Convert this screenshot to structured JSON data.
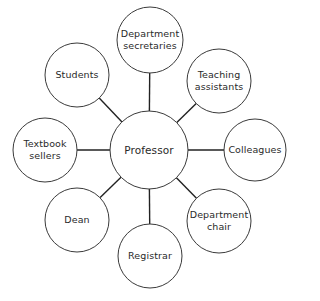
{
  "diagram": {
    "type": "hub-and-spoke",
    "center": {
      "id": "professor",
      "label_lines": [
        "Professor"
      ],
      "x": 149,
      "y": 150,
      "r": 39
    },
    "nodes": [
      {
        "id": "department-secretaries",
        "label_lines": [
          "Department",
          "secretaries"
        ],
        "x": 150,
        "y": 40,
        "r": 33
      },
      {
        "id": "teaching-assistants",
        "label_lines": [
          "Teaching",
          "assistants"
        ],
        "x": 219,
        "y": 81,
        "r": 32
      },
      {
        "id": "colleagues",
        "label_lines": [
          "Colleagues"
        ],
        "x": 255,
        "y": 150,
        "r": 31
      },
      {
        "id": "department-chair",
        "label_lines": [
          "Department",
          "chair"
        ],
        "x": 219,
        "y": 221,
        "r": 32
      },
      {
        "id": "registrar",
        "label_lines": [
          "Registrar"
        ],
        "x": 150,
        "y": 256,
        "r": 32
      },
      {
        "id": "dean",
        "label_lines": [
          "Dean"
        ],
        "x": 77,
        "y": 220,
        "r": 32
      },
      {
        "id": "textbook-sellers",
        "label_lines": [
          "Textbook",
          "sellers"
        ],
        "x": 45,
        "y": 150,
        "r": 32
      },
      {
        "id": "students",
        "label_lines": [
          "Students"
        ],
        "x": 77,
        "y": 75,
        "r": 32
      }
    ],
    "colors": {
      "stroke": "#3a3a3a",
      "edge": "#222222",
      "text": "#2a2a2a",
      "background": "#ffffff"
    }
  }
}
